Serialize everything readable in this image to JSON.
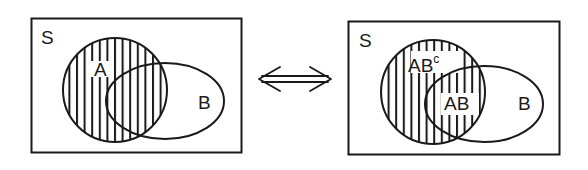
{
  "diagram": {
    "type": "venn-equivalence",
    "colors": {
      "stroke": "#1a1a1a",
      "background": "#ffffff"
    },
    "left_panel": {
      "universe_label": "S",
      "set_a_label": "A",
      "set_b_label": "B",
      "shaded_region": "A"
    },
    "arrow": {
      "symbol": "⇔",
      "meaning": "equivalent"
    },
    "right_panel": {
      "universe_label": "S",
      "region_a_not_b_label": "AB",
      "region_a_not_b_superscript": "c",
      "region_ab_label": "AB",
      "set_b_label": "B",
      "shaded_regions": [
        "AB^c",
        "AB"
      ]
    }
  }
}
